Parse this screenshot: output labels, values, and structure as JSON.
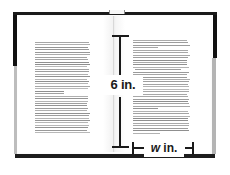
{
  "figure": {
    "kind": "open-book-dimension-diagram",
    "background_color": "#ffffff",
    "ink_color": "#1a1a1a"
  },
  "book": {
    "cover_color": "#111111",
    "page_edge_color": "#bdbdbd",
    "paper_color": "#ffffff",
    "text_line_color": "#8e8e8e",
    "left_page": {
      "name": "left-page",
      "text_lines": 46
    },
    "right_page": {
      "name": "right-page",
      "text_lines": 47
    }
  },
  "dimensions": {
    "height": {
      "label": "6 in.",
      "value": 6,
      "unit": "in.",
      "orientation": "vertical",
      "measures": "page height"
    },
    "width": {
      "label_variable": "w",
      "label_unit": "in.",
      "value": null,
      "unit": "in.",
      "orientation": "horizontal",
      "measures": "page width"
    }
  }
}
